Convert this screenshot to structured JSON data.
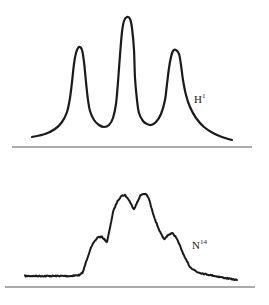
{
  "figure": {
    "stroke_color": "#1a1a1a",
    "axis_color": "#555555",
    "panels": [
      {
        "id": "top",
        "label": {
          "base": "H",
          "superscript": "1",
          "x": 194,
          "y": 94
        },
        "axis": {
          "x1": 12,
          "x2": 252,
          "y": 147
        },
        "stroke_width": 2.2,
        "noise": 0,
        "points": [
          [
            32,
            137
          ],
          [
            45,
            134
          ],
          [
            55,
            129
          ],
          [
            62,
            122
          ],
          [
            67,
            112
          ],
          [
            70,
            98
          ],
          [
            72,
            82
          ],
          [
            74,
            64
          ],
          [
            76,
            53
          ],
          [
            79,
            47
          ],
          [
            82,
            50
          ],
          [
            84,
            62
          ],
          [
            86,
            82
          ],
          [
            88,
            100
          ],
          [
            90,
            111
          ],
          [
            94,
            120
          ],
          [
            99,
            125
          ],
          [
            104,
            127
          ],
          [
            109,
            125
          ],
          [
            113,
            118
          ],
          [
            116,
            104
          ],
          [
            118,
            82
          ],
          [
            120,
            55
          ],
          [
            122,
            32
          ],
          [
            124,
            21
          ],
          [
            127,
            17
          ],
          [
            130,
            19
          ],
          [
            132,
            28
          ],
          [
            134,
            50
          ],
          [
            135,
            78
          ],
          [
            137,
            100
          ],
          [
            139,
            113
          ],
          [
            143,
            121
          ],
          [
            147,
            124
          ],
          [
            151,
            125
          ],
          [
            156,
            122
          ],
          [
            161,
            114
          ],
          [
            165,
            100
          ],
          [
            167,
            84
          ],
          [
            169,
            68
          ],
          [
            171,
            57
          ],
          [
            173,
            51
          ],
          [
            176,
            50
          ],
          [
            179,
            54
          ],
          [
            181,
            65
          ],
          [
            183,
            80
          ],
          [
            186,
            95
          ],
          [
            190,
            107
          ],
          [
            196,
            118
          ],
          [
            204,
            127
          ],
          [
            213,
            133
          ],
          [
            222,
            137
          ],
          [
            232,
            140
          ]
        ]
      },
      {
        "id": "bottom",
        "label": {
          "base": "N",
          "superscript": "14",
          "x": 192,
          "y": 240
        },
        "axis": {
          "x1": 5,
          "x2": 255,
          "y": 287
        },
        "stroke_width": 2.0,
        "noise": 1.2,
        "points": [
          [
            25,
            276
          ],
          [
            40,
            276
          ],
          [
            55,
            276
          ],
          [
            70,
            276
          ],
          [
            80,
            275
          ],
          [
            83,
            272
          ],
          [
            86,
            262
          ],
          [
            90,
            250
          ],
          [
            94,
            242
          ],
          [
            98,
            237
          ],
          [
            102,
            237
          ],
          [
            105,
            240
          ],
          [
            107,
            242
          ],
          [
            110,
            228
          ],
          [
            113,
            212
          ],
          [
            117,
            202
          ],
          [
            121,
            196
          ],
          [
            125,
            195
          ],
          [
            129,
            200
          ],
          [
            132,
            206
          ],
          [
            134,
            209
          ],
          [
            137,
            203
          ],
          [
            140,
            196
          ],
          [
            143,
            194
          ],
          [
            146,
            194
          ],
          [
            149,
            199
          ],
          [
            152,
            210
          ],
          [
            156,
            222
          ],
          [
            160,
            232
          ],
          [
            163,
            238
          ],
          [
            165,
            239
          ],
          [
            168,
            235
          ],
          [
            172,
            233
          ],
          [
            176,
            237
          ],
          [
            180,
            246
          ],
          [
            185,
            258
          ],
          [
            190,
            267
          ],
          [
            197,
            272
          ],
          [
            205,
            274
          ],
          [
            215,
            276
          ],
          [
            225,
            278
          ],
          [
            237,
            280
          ]
        ]
      }
    ]
  }
}
